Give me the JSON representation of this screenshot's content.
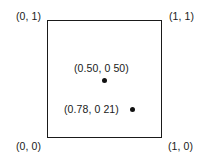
{
  "diagram": {
    "type": "unit-square",
    "corners": {
      "top_left": "(0, 1)",
      "top_right": "(1, 1)",
      "bottom_left": "(0, 0)",
      "bottom_right": "(1, 0)"
    },
    "points": [
      {
        "label": "(0.50, 0 50)",
        "x": 0.5,
        "y": 0.5
      },
      {
        "label": "(0.78, 0 21)",
        "x": 0.78,
        "y": 0.21
      }
    ]
  }
}
